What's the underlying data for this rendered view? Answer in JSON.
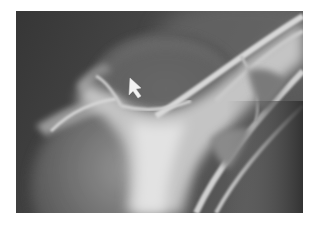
{
  "image": {
    "kind": "radiograph",
    "description": "Shoulder X-ray with arrow marker",
    "background_color": "#ffffff",
    "frame": {
      "x": 16,
      "y": 11,
      "width": 287,
      "height": 202
    },
    "colors": {
      "dark_soft_tissue": "#3a3a3a",
      "mid_tissue": "#6e6e6e",
      "bone": "#cfcfcf",
      "bright_bone": "#e8e8e8",
      "arrow": "#f2f2f2"
    }
  },
  "annotations": {
    "arrow": {
      "icon": "arrow-pointer-icon",
      "direction": "up-left",
      "tip": {
        "x": 130,
        "y": 78
      }
    }
  }
}
